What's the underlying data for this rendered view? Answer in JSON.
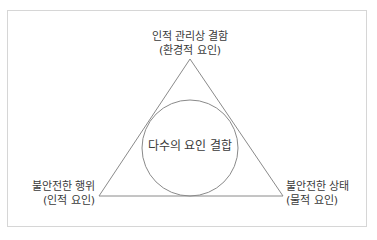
{
  "diagram": {
    "top_label": {
      "line1": "인적 관리상 결함",
      "line2": "(환경적 요인)"
    },
    "left_label": {
      "line1": "불안전한 행위",
      "line2": "(인적 요인)"
    },
    "right_label": {
      "line1": "불안전한 상태",
      "line2": "(물적 요인)"
    },
    "center_label": "다수의 요인 결합",
    "colors": {
      "line": "#8a8a8a",
      "border": "#d6d6d6",
      "text": "#3a3a3a"
    }
  }
}
